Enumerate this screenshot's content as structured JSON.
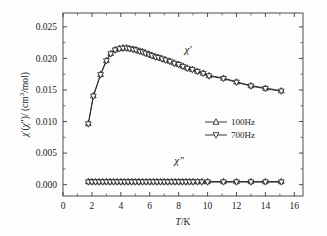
{
  "chart_data": {
    "type": "line",
    "title": "",
    "xlabel": "T/K",
    "ylabel": "χ′(χ″)/ (cm³/mol)",
    "xlim": [
      0,
      16.6
    ],
    "ylim": [
      -0.0018,
      0.0272
    ],
    "xticks": [
      0,
      2,
      4,
      6,
      8,
      10,
      12,
      14,
      16
    ],
    "xtick_labels": [
      "0",
      "2",
      "4",
      "6",
      "8",
      "10",
      "12",
      "14",
      "16"
    ],
    "yticks": [
      0.0,
      0.005,
      0.01,
      0.015,
      0.02,
      0.025
    ],
    "ytick_labels": [
      "0.000",
      "0.005",
      "0.010",
      "0.015",
      "0.020",
      "0.025"
    ],
    "grid": false,
    "legend_position": "center-right",
    "annotations": [
      {
        "text": "χ′",
        "x": 8.4,
        "y": 0.0208,
        "name": "chi-prime-annotation"
      },
      {
        "text": "χ″",
        "x": 7.7,
        "y": 0.0032,
        "name": "chi-double-prime-annotation"
      }
    ],
    "legend": [
      {
        "label": "100Hz",
        "marker": "triangle-up"
      },
      {
        "label": "700Hz",
        "marker": "triangle-down"
      }
    ],
    "series": [
      {
        "name": "100Hz",
        "component": "chi-prime",
        "marker": "triangle-up",
        "x": [
          1.75,
          2.1,
          2.6,
          3.0,
          3.3,
          3.6,
          3.9,
          4.15,
          4.4,
          4.6,
          4.85,
          5.05,
          5.3,
          5.5,
          5.7,
          5.95,
          6.15,
          6.4,
          6.6,
          6.85,
          7.1,
          7.4,
          7.7,
          8.0,
          8.3,
          8.6,
          8.95,
          9.3,
          9.7,
          10.1,
          11.1,
          12.0,
          13.0,
          14.0,
          15.1
        ],
        "values": [
          0.0097,
          0.0141,
          0.0175,
          0.0197,
          0.0208,
          0.0214,
          0.0216,
          0.0217,
          0.0217,
          0.0216,
          0.0215,
          0.0214,
          0.0212,
          0.0211,
          0.0209,
          0.0207,
          0.0205,
          0.0203,
          0.0202,
          0.02,
          0.0198,
          0.0196,
          0.0193,
          0.0191,
          0.0188,
          0.0185,
          0.0183,
          0.018,
          0.0177,
          0.0173,
          0.0169,
          0.0163,
          0.0157,
          0.0153,
          0.0149
        ]
      },
      {
        "name": "700Hz",
        "component": "chi-prime",
        "marker": "triangle-down",
        "x": [
          1.75,
          2.1,
          2.6,
          3.0,
          3.3,
          3.6,
          3.9,
          4.15,
          4.4,
          4.6,
          4.85,
          5.05,
          5.3,
          5.5,
          5.7,
          5.95,
          6.15,
          6.4,
          6.6,
          6.85,
          7.1,
          7.4,
          7.7,
          8.0,
          8.3,
          8.6,
          8.95,
          9.3,
          9.7,
          10.1,
          11.1,
          12.0,
          13.0,
          14.0,
          15.1
        ],
        "values": [
          0.0096,
          0.014,
          0.0174,
          0.0196,
          0.0207,
          0.0213,
          0.0215,
          0.0216,
          0.0216,
          0.0215,
          0.0214,
          0.0213,
          0.0211,
          0.021,
          0.0208,
          0.0206,
          0.0204,
          0.0202,
          0.0201,
          0.0199,
          0.0197,
          0.0195,
          0.0192,
          0.019,
          0.0187,
          0.0184,
          0.0182,
          0.0179,
          0.0176,
          0.0172,
          0.0168,
          0.0162,
          0.0156,
          0.0152,
          0.0148
        ]
      },
      {
        "name": "100Hz",
        "component": "chi-double-prime",
        "marker": "triangle-up",
        "x": [
          1.75,
          2.0,
          2.25,
          2.5,
          2.75,
          3.0,
          3.25,
          3.5,
          3.75,
          4.0,
          4.25,
          4.5,
          4.75,
          5.0,
          5.25,
          5.5,
          5.75,
          6.0,
          6.25,
          6.5,
          6.75,
          7.0,
          7.25,
          7.5,
          7.75,
          8.0,
          8.25,
          8.5,
          8.75,
          9.0,
          9.3,
          9.6,
          10.0,
          11.1,
          12.0,
          13.0,
          14.0,
          15.1
        ],
        "values": [
          0.0005,
          0.0005,
          0.0005,
          0.0005,
          0.0005,
          0.0005,
          0.0005,
          0.0005,
          0.0005,
          0.0005,
          0.0005,
          0.0005,
          0.0005,
          0.0005,
          0.0005,
          0.0005,
          0.0005,
          0.0005,
          0.0005,
          0.0005,
          0.0005,
          0.0005,
          0.0005,
          0.0005,
          0.0005,
          0.0005,
          0.0005,
          0.0005,
          0.0005,
          0.0005,
          0.0005,
          0.0005,
          0.0005,
          0.0005,
          0.0005,
          0.0005,
          0.0005,
          0.0005
        ]
      },
      {
        "name": "700Hz",
        "component": "chi-double-prime",
        "marker": "triangle-down",
        "x": [
          1.75,
          2.0,
          2.25,
          2.5,
          2.75,
          3.0,
          3.25,
          3.5,
          3.75,
          4.0,
          4.25,
          4.5,
          4.75,
          5.0,
          5.25,
          5.5,
          5.75,
          6.0,
          6.25,
          6.5,
          6.75,
          7.0,
          7.25,
          7.5,
          7.75,
          8.0,
          8.25,
          8.5,
          8.75,
          9.0,
          9.3,
          9.6,
          10.0,
          11.1,
          12.0,
          13.0,
          14.0,
          15.1
        ],
        "values": [
          0.0004,
          0.0004,
          0.0004,
          0.0004,
          0.0004,
          0.0004,
          0.0004,
          0.0004,
          0.0004,
          0.0004,
          0.0004,
          0.0004,
          0.0004,
          0.0004,
          0.0004,
          0.0004,
          0.0004,
          0.0004,
          0.0004,
          0.0004,
          0.0004,
          0.0004,
          0.0004,
          0.0004,
          0.0004,
          0.0004,
          0.0004,
          0.0004,
          0.0004,
          0.0004,
          0.0004,
          0.0004,
          0.0004,
          0.0004,
          0.0004,
          0.0004,
          0.0004,
          0.0004
        ]
      }
    ],
    "colors": {
      "axis": "#3a3a3a",
      "data": "#1a1a1a",
      "marker_fill": "#ffffff",
      "background": "#fdfdfd"
    }
  }
}
